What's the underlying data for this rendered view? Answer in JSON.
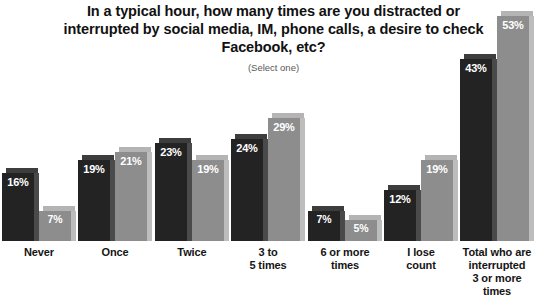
{
  "chart_data": {
    "type": "bar",
    "title": "In a typical hour, how many times are you distracted or interrupted by social media, IM, phone calls, a desire to check Facebook, etc?",
    "subtitle": "(Select one)",
    "xlabel": "",
    "ylabel": "",
    "ylim": [
      0,
      56
    ],
    "grid": false,
    "legend": "none",
    "categories": [
      "Never",
      "Once",
      "Twice",
      "3 to\n5 times",
      "6 or more\ntimes",
      "I lose\ncount",
      "Total who are\ninterrupted\n3 or more\ntimes"
    ],
    "series": [
      {
        "name": "series-dark",
        "color": "#232323",
        "values": [
          16,
          19,
          23,
          24,
          7,
          12,
          43
        ]
      },
      {
        "name": "series-light",
        "color": "#8d8d8d",
        "values": [
          7,
          21,
          19,
          29,
          5,
          19,
          53
        ]
      }
    ],
    "value_labels": {
      "dark": [
        "16%",
        "19%",
        "23%",
        "24%",
        "7%",
        "12%",
        "43%"
      ],
      "light": [
        "7%",
        "21%",
        "19%",
        "29%",
        "5%",
        "19%",
        "53%"
      ]
    }
  },
  "categories_display": [
    {
      "line1": "Never",
      "line2": "",
      "line3": "",
      "line4": ""
    },
    {
      "line1": "Once",
      "line2": "",
      "line3": "",
      "line4": ""
    },
    {
      "line1": "Twice",
      "line2": "",
      "line3": "",
      "line4": ""
    },
    {
      "line1": "3 to",
      "line2": "5 times",
      "line3": "",
      "line4": ""
    },
    {
      "line1": "6 or more",
      "line2": "times",
      "line3": "",
      "line4": ""
    },
    {
      "line1": "I lose",
      "line2": "count",
      "line3": "",
      "line4": ""
    },
    {
      "line1": "Total who are",
      "line2": "interrupted",
      "line3": "3 or more",
      "line4": "times"
    }
  ],
  "colors": {
    "dark_bar": "#232323",
    "light_bar": "#8d8d8d",
    "label_text": "#141414",
    "value_text": "#ffffff",
    "title_text": "#111111",
    "subtitle_text": "#5a5a5a",
    "background": "#ffffff"
  }
}
